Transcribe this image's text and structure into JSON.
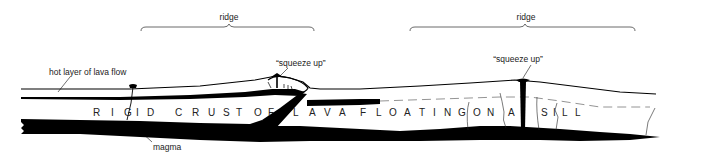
{
  "diagram": {
    "labels": {
      "ridge_left": "ridge",
      "ridge_right": "ridge",
      "squeeze_up_left": "“squeeze up”",
      "squeeze_up_right": "“squeeze up”",
      "hot_layer": "hot layer of lava flow",
      "magma": "magma"
    },
    "crust_letters": [
      "R",
      "I",
      "G",
      "I",
      "D",
      "C",
      "R",
      "U",
      "S",
      "T",
      "O",
      "F",
      "L",
      "A",
      "V",
      "A",
      "F",
      "L",
      "O",
      "A",
      "T",
      "I",
      "N",
      "G",
      "O",
      "N",
      "A",
      "S",
      "I",
      "L",
      "L"
    ],
    "crust_text": "RIGID CRUST OF LAVA FLOATING ON A SILL",
    "colors": {
      "ink": "#000000",
      "text": "#222222",
      "background": "#ffffff",
      "dashed": "#888888"
    }
  }
}
